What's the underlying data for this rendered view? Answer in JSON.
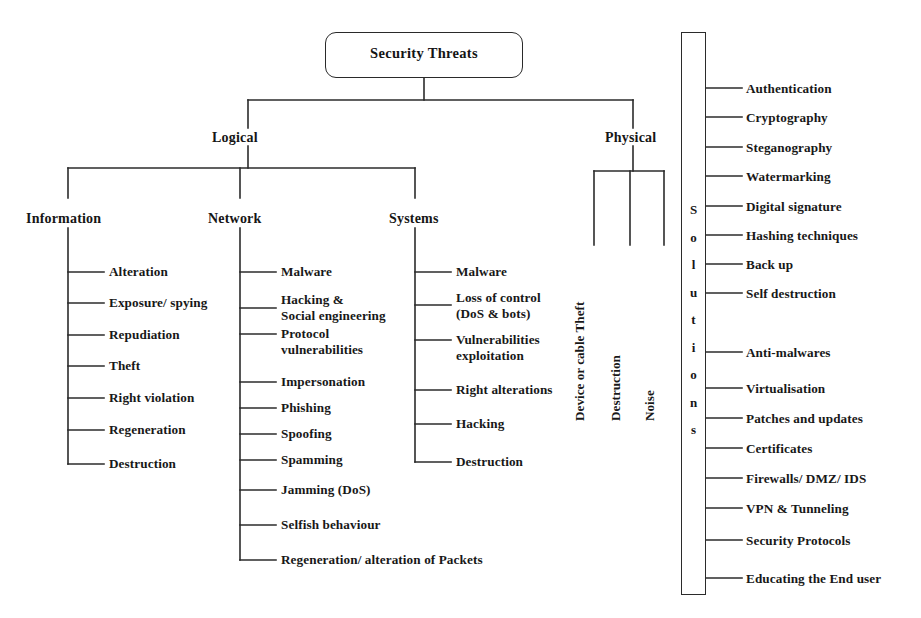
{
  "diagram": {
    "title": "Security Threats",
    "root": {
      "label": "Security Threats"
    },
    "level2": [
      {
        "label": "Logical"
      },
      {
        "label": "Physical"
      }
    ],
    "logical_children": [
      {
        "label": "Information"
      },
      {
        "label": "Network"
      },
      {
        "label": "Systems"
      }
    ],
    "information_items": [
      "Alteration",
      "Exposure/ spying",
      "Repudiation",
      "Theft",
      "Right violation",
      "Regeneration",
      "Destruction"
    ],
    "network_items": [
      "Malware",
      "Hacking &\nSocial engineering",
      "Protocol\n vulnerabilities",
      "Impersonation",
      "Phishing",
      "Spoofing",
      "Spamming",
      "Jamming (DoS)",
      "Selfish behaviour",
      "Regeneration/ alteration of Packets"
    ],
    "systems_items": [
      "Malware",
      "Loss of control\n (DoS & bots)",
      "Vulnerabilities\n  exploitation",
      "Right alterations",
      "Hacking",
      "Destruction"
    ],
    "physical_items": [
      "Device or cable Theft",
      "Destruction",
      "Noise"
    ],
    "solutions_box": {
      "vertical_label": "Solutions",
      "letters": [
        "S",
        "o",
        "l",
        "u",
        "t",
        "i",
        "o",
        "n",
        "s"
      ]
    },
    "solutions_items": [
      "Authentication",
      "Cryptography",
      "Steganography",
      "Watermarking",
      "Digital signature",
      "Hashing techniques",
      "Back up",
      "Self destruction",
      "Anti-malwares",
      "Virtualisation",
      "Patches and updates",
      "Certificates",
      "Firewalls/ DMZ/ IDS",
      "VPN & Tunneling",
      "Security Protocols",
      "Educating the End user"
    ],
    "colors": {
      "line": "#2b2b2b",
      "text": "#181818",
      "background": "#ffffff"
    }
  }
}
